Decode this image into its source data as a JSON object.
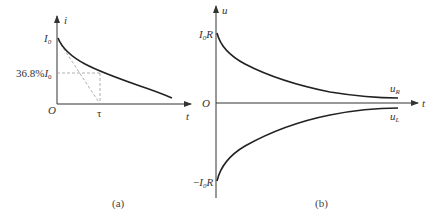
{
  "panel_a": {
    "caption": "(a)",
    "y_axis_label": "i",
    "x_axis_label": "t",
    "origin_label": "O",
    "initial_value_label": "I",
    "initial_value_sub": "0",
    "level_label_prefix": "36.8%",
    "level_label_var": "I",
    "level_label_sub": "0",
    "tau_label": "τ",
    "curve": "i = I0·e^(-t/τ)",
    "colors": {
      "curve": "#222222",
      "axis": "#333333",
      "dashed": "#999999"
    }
  },
  "panel_b": {
    "caption": "(b)",
    "y_axis_label": "u",
    "x_axis_label": "t",
    "origin_label": "O",
    "top_value_label": "I",
    "top_value_sub": "0",
    "top_value_suffix": "R",
    "bottom_value_prefix": "−",
    "bottom_value_label": "I",
    "bottom_value_sub": "0",
    "bottom_value_suffix": "R",
    "upper_curve_label": "u",
    "upper_curve_sub": "R",
    "lower_curve_label": "u",
    "lower_curve_sub": "L",
    "colors": {
      "curve": "#222222",
      "axis": "#333333"
    }
  }
}
